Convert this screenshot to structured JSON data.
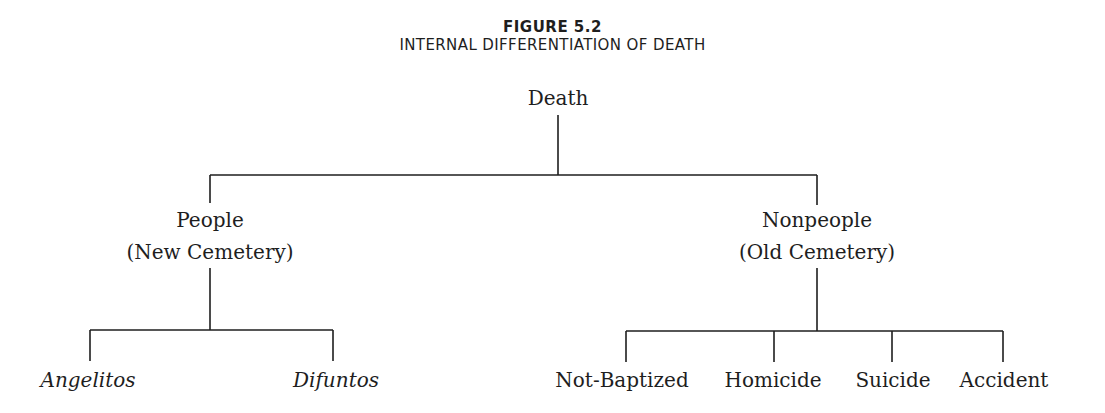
{
  "figure": {
    "label": "FIGURE 5.2",
    "title": "INTERNAL DIFFERENTIATION OF DEATH"
  },
  "tree": {
    "root": "Death",
    "branches": [
      {
        "label": "People",
        "sublabel": "(New Cemetery)",
        "children": [
          "Angelitos",
          "Difuntos"
        ]
      },
      {
        "label": "Nonpeople",
        "sublabel": "(Old Cemetery)",
        "children": [
          "Not-Baptized",
          "Homicide",
          "Suicide",
          "Accident"
        ]
      }
    ]
  },
  "colors": {
    "line": "#1e1e1e",
    "text": "#1e1e1e",
    "background": "#ffffff"
  }
}
